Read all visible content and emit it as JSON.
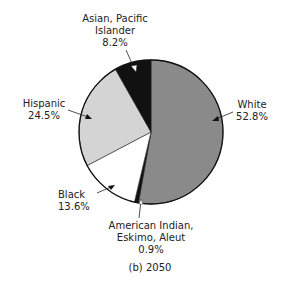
{
  "chart_data": {
    "type": "pie",
    "title": "(b) 2050",
    "categories": [
      "White",
      "American Indian, Eskimo, Aleut",
      "Black",
      "Hispanic",
      "Asian, Pacific Islander"
    ],
    "values": [
      52.8,
      0.9,
      13.6,
      24.5,
      8.2
    ],
    "unit": "%",
    "start_angle": "12 o'clock, clockwise",
    "slice_colors": [
      "#8a8a8a",
      "#111111",
      "#ffffff",
      "#d4d4d4",
      "#111111"
    ],
    "legend": "none (callout labels with arrows)"
  },
  "labels": {
    "asian": {
      "line1": "Asian, Pacific",
      "line2": "Islander",
      "value": "8.2%"
    },
    "hispanic": {
      "line1": "Hispanic",
      "value": "24.5%"
    },
    "white": {
      "line1": "White",
      "value": "52.8%"
    },
    "black": {
      "line1": "Black",
      "value": "13.6%"
    },
    "amindian": {
      "line1": "American Indian,",
      "line2": "Eskimo, Aleut",
      "value": "0.9%"
    }
  },
  "caption": "(b) 2050"
}
